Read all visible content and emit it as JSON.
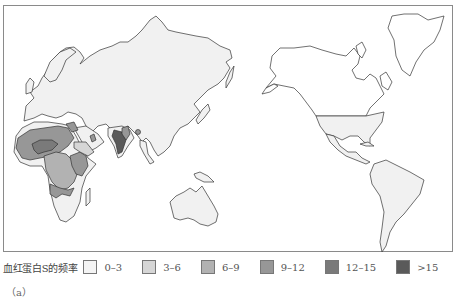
{
  "map": {
    "title": "血红蛋白S的频率",
    "projection": "Pacific-centered world map",
    "base_land_color": "#f1f1f1",
    "outline_color": "#333333",
    "shaded_regions": [
      {
        "region": "Sub-Saharan West Africa (Sahel belt)",
        "class": "9-12"
      },
      {
        "region": "West Africa core (Nigeria area)",
        "class": "12-15"
      },
      {
        "region": "Central Africa / Congo basin",
        "class": "6-9"
      },
      {
        "region": "East Africa (Great Lakes)",
        "class": "9-12"
      },
      {
        "region": "Southern Central Africa (Angola/Zambia)",
        "class": "9-12"
      },
      {
        "region": "Horn of Africa",
        "class": "3-6"
      },
      {
        "region": "Arabian Peninsula pockets",
        "class": "9-12"
      },
      {
        "region": "Eastern Mediterranean / Turkey",
        "class": "9-12"
      },
      {
        "region": "Central India",
        "class": ">15"
      },
      {
        "region": "Eastern India",
        "class": "9-12"
      },
      {
        "region": "United States (southern)",
        "class": "0-3"
      },
      {
        "region": "Eurasia, Australia, South America, Southern Africa",
        "class": "0-3"
      }
    ]
  },
  "legend": {
    "title": "血红蛋白S的频率",
    "items": [
      {
        "label": "0–3",
        "color": "#f4f4f4"
      },
      {
        "label": "3–6",
        "color": "#d6d6d6"
      },
      {
        "label": "6–9",
        "color": "#b2b2b2"
      },
      {
        "label": "9–12",
        "color": "#979797"
      },
      {
        "label": "12–15",
        "color": "#7a7a7a"
      },
      {
        "label": ">15",
        "color": "#5a5a5a"
      }
    ]
  },
  "caption": "（a）"
}
